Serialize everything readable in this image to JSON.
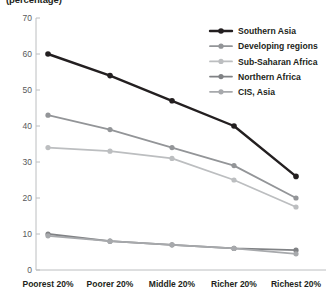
{
  "chart_data": {
    "type": "line",
    "title": "(percentage)",
    "xlabel": "",
    "ylabel": "",
    "ylim": [
      0,
      70
    ],
    "yticks": [
      0,
      10,
      20,
      30,
      40,
      50,
      60,
      70
    ],
    "grid": false,
    "legend_position": "top-right",
    "categories": [
      "Poorest 20%",
      "Poorer 20%",
      "Middle 20%",
      "Richer 20%",
      "Richest 20%"
    ],
    "series": [
      {
        "name": "Southern Asia",
        "color": "#231f20",
        "values": [
          60,
          54,
          47,
          40,
          26
        ]
      },
      {
        "name": "Developing regions",
        "color": "#939598",
        "values": [
          43,
          39,
          34,
          29,
          20
        ]
      },
      {
        "name": "Sub-Saharan Africa",
        "color": "#bcbec0",
        "values": [
          34,
          33,
          31,
          25,
          17.5
        ]
      },
      {
        "name": "Northern Africa",
        "color": "#808285",
        "values": [
          10,
          8,
          7,
          6,
          5.5
        ]
      },
      {
        "name": "CIS, Asia",
        "color": "#a7a9ac",
        "values": [
          9.5,
          8,
          7,
          6,
          4.5
        ]
      }
    ]
  },
  "axis": {
    "ytick_labels": [
      "70",
      "60",
      "50",
      "40",
      "30",
      "20",
      "10",
      "0"
    ],
    "xtick_labels": [
      "Poorest 20%",
      "Poorer 20%",
      "Middle 20%",
      "Richer 20%",
      "Richest 20%"
    ]
  },
  "legend": {
    "items": [
      {
        "label": "Southern Asia",
        "color": "#231f20"
      },
      {
        "label": "Developing regions",
        "color": "#939598"
      },
      {
        "label": "Sub-Saharan Africa",
        "color": "#bcbec0"
      },
      {
        "label": "Northern Africa",
        "color": "#808285"
      },
      {
        "label": "CIS, Asia",
        "color": "#a7a9ac"
      }
    ]
  }
}
